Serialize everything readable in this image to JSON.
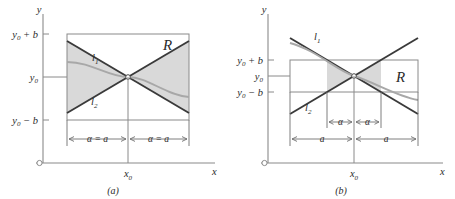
{
  "figure": {
    "caption_a": "(a)",
    "caption_b": "(b)"
  },
  "panel_a": {
    "axis": {
      "y_label": "y",
      "x_label": "x",
      "origin_marker": "open-circle"
    },
    "y_ticks": [
      {
        "label": "y",
        "sub": "0",
        "suffix": " + b"
      },
      {
        "label": "y",
        "sub": "0",
        "suffix": ""
      },
      {
        "label": "y",
        "sub": "0",
        "suffix": " − b"
      }
    ],
    "x_ticks": [
      {
        "label": "x",
        "sub": "0"
      }
    ],
    "region_label": "R",
    "line_labels": [
      {
        "label": "l",
        "sub": "1"
      },
      {
        "label": "l",
        "sub": "2"
      }
    ],
    "dimensions": [
      {
        "label": "α = a",
        "side": "left"
      },
      {
        "label": "α = a",
        "side": "right"
      }
    ]
  },
  "panel_b": {
    "axis": {
      "y_label": "y",
      "x_label": "x",
      "origin_marker": "open-circle"
    },
    "y_ticks": [
      {
        "label": "y",
        "sub": "0",
        "suffix": " + b"
      },
      {
        "label": "y",
        "sub": "0",
        "suffix": ""
      },
      {
        "label": "y",
        "sub": "0",
        "suffix": " − b"
      }
    ],
    "x_ticks": [
      {
        "label": "x",
        "sub": "0"
      }
    ],
    "region_label": "R",
    "line_labels": [
      {
        "label": "l",
        "sub": "1"
      },
      {
        "label": "l",
        "sub": "2"
      }
    ],
    "dimensions_inner": [
      {
        "label": "α",
        "side": "left"
      },
      {
        "label": "α",
        "side": "right"
      }
    ],
    "dimensions_outer": [
      {
        "label": "a",
        "side": "left"
      },
      {
        "label": "a",
        "side": "right"
      }
    ]
  },
  "colors": {
    "axis": "#8a8a8a",
    "slope_line": "#3a3a3a",
    "solution_curve": "#a8a8a8",
    "wedge_fill": "#d9d9d9",
    "text": "#2b2b2b",
    "background": "#ffffff"
  }
}
